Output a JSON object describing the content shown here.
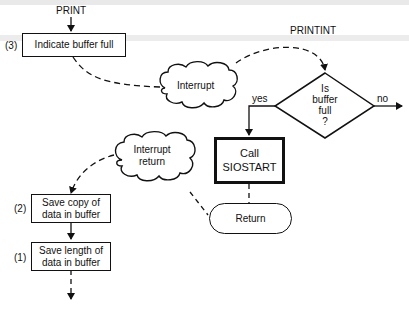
{
  "diagram": {
    "entry_labels": {
      "print": "PRINT",
      "printint": "PRINTINT"
    },
    "steps": [
      {
        "number": "(3)",
        "text": "Indicate buffer full"
      },
      {
        "number": "(2)",
        "text_line1": "Save copy of",
        "text_line2": "data in buffer"
      },
      {
        "number": "(1)",
        "text_line1": "Save length of",
        "text_line2": "data in buffer"
      }
    ],
    "clouds": {
      "interrupt": "Interrupt",
      "interrupt_return_line1": "Interrupt",
      "interrupt_return_line2": "return"
    },
    "decision": {
      "line1": "Is",
      "line2": "buffer",
      "line3": "full",
      "line4": "?",
      "yes_label": "yes",
      "no_label": "no"
    },
    "call_box": {
      "line1": "Call",
      "line2": "SIOSTART"
    },
    "terminator": "Return"
  }
}
